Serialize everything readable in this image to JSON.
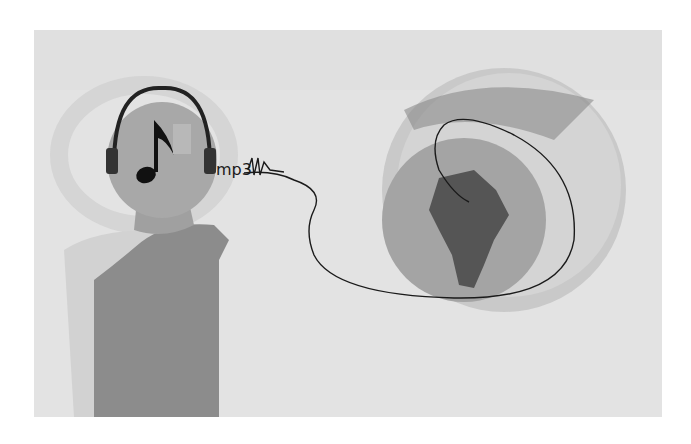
{
  "illustration": {
    "label_text": "mp3",
    "subjects": [
      "person-with-headphones",
      "music-note",
      "globe-south-america",
      "cable-orbit"
    ],
    "colors": {
      "background": "#e6e6e6",
      "figure": "#8c8c8c",
      "continent": "#555555",
      "line": "#1a1a1a"
    }
  }
}
